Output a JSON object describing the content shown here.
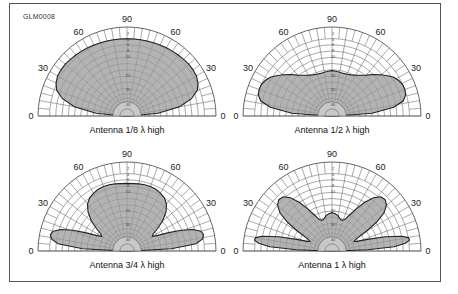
{
  "figure_id": "GLM0008",
  "angle_labels": [
    "0",
    "30",
    "60",
    "90",
    "60",
    "30",
    "0"
  ],
  "radial_scale_labels": [
    "2",
    "4",
    "6",
    "8",
    "10",
    "20",
    "30",
    "40"
  ],
  "colors": {
    "grid": "#555555",
    "pattern_fill": "#9a9a9a",
    "pattern_stroke": "#222222",
    "inner_fill": "#c8c8c8",
    "frame": "#555555"
  },
  "plots": [
    {
      "caption": "Antenna 1/8 λ  high",
      "center": [
        127,
        116
      ],
      "pattern": [
        [
          0,
          0.04
        ],
        [
          5,
          0.35
        ],
        [
          10,
          0.6
        ],
        [
          15,
          0.75
        ],
        [
          20,
          0.84
        ],
        [
          25,
          0.88
        ],
        [
          30,
          0.9
        ],
        [
          35,
          0.905
        ],
        [
          40,
          0.905
        ],
        [
          45,
          0.9
        ],
        [
          50,
          0.895
        ],
        [
          55,
          0.89
        ],
        [
          60,
          0.885
        ],
        [
          65,
          0.88
        ],
        [
          70,
          0.875
        ],
        [
          75,
          0.872
        ],
        [
          80,
          0.87
        ],
        [
          85,
          0.868
        ],
        [
          90,
          0.868
        ]
      ]
    },
    {
      "caption": "Antenna 1/2 λ  high",
      "center": [
        332,
        116
      ],
      "pattern": [
        [
          0,
          0.04
        ],
        [
          4,
          0.45
        ],
        [
          8,
          0.7
        ],
        [
          12,
          0.82
        ],
        [
          16,
          0.86
        ],
        [
          20,
          0.87
        ],
        [
          24,
          0.87
        ],
        [
          28,
          0.85
        ],
        [
          32,
          0.82
        ],
        [
          36,
          0.77
        ],
        [
          40,
          0.72
        ],
        [
          45,
          0.66
        ],
        [
          50,
          0.6
        ],
        [
          55,
          0.56
        ],
        [
          60,
          0.53
        ],
        [
          65,
          0.51
        ],
        [
          70,
          0.5
        ],
        [
          75,
          0.495
        ],
        [
          80,
          0.5
        ],
        [
          85,
          0.505
        ],
        [
          90,
          0.51
        ]
      ]
    },
    {
      "caption": "Antenna 3/4 λ  high",
      "center": [
        127,
        251
      ],
      "pattern": [
        [
          0,
          0.04
        ],
        [
          3,
          0.5
        ],
        [
          6,
          0.78
        ],
        [
          9,
          0.86
        ],
        [
          12,
          0.88
        ],
        [
          15,
          0.86
        ],
        [
          18,
          0.78
        ],
        [
          21,
          0.65
        ],
        [
          24,
          0.5
        ],
        [
          27,
          0.38
        ],
        [
          30,
          0.33
        ],
        [
          33,
          0.35
        ],
        [
          36,
          0.42
        ],
        [
          40,
          0.52
        ],
        [
          45,
          0.62
        ],
        [
          50,
          0.69
        ],
        [
          55,
          0.73
        ],
        [
          60,
          0.75
        ],
        [
          65,
          0.765
        ],
        [
          70,
          0.77
        ],
        [
          75,
          0.77
        ],
        [
          80,
          0.765
        ],
        [
          85,
          0.76
        ],
        [
          90,
          0.76
        ]
      ]
    },
    {
      "caption": "Antenna 1 λ  high",
      "center": [
        332,
        251
      ],
      "pattern": [
        [
          0,
          0.04
        ],
        [
          2,
          0.4
        ],
        [
          4,
          0.7
        ],
        [
          6,
          0.83
        ],
        [
          8,
          0.88
        ],
        [
          10,
          0.87
        ],
        [
          12,
          0.8
        ],
        [
          15,
          0.62
        ],
        [
          18,
          0.42
        ],
        [
          21,
          0.3
        ],
        [
          24,
          0.27
        ],
        [
          27,
          0.32
        ],
        [
          30,
          0.45
        ],
        [
          33,
          0.6
        ],
        [
          36,
          0.72
        ],
        [
          40,
          0.8
        ],
        [
          44,
          0.83
        ],
        [
          48,
          0.82
        ],
        [
          52,
          0.76
        ],
        [
          56,
          0.66
        ],
        [
          60,
          0.55
        ],
        [
          64,
          0.45
        ],
        [
          68,
          0.38
        ],
        [
          72,
          0.36
        ],
        [
          76,
          0.37
        ],
        [
          80,
          0.4
        ],
        [
          85,
          0.42
        ],
        [
          90,
          0.43
        ]
      ]
    }
  ]
}
